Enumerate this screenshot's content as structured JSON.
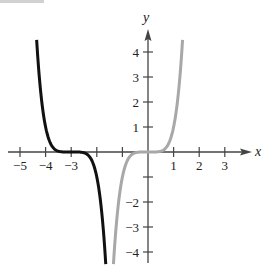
{
  "chart_data": {
    "type": "line",
    "title": "",
    "xlabel": "x",
    "ylabel": "y",
    "xlim": [
      -5.5,
      4.2
    ],
    "ylim": [
      -4.4,
      4.8
    ],
    "grid": false,
    "legend": null,
    "x_ticks": [
      -5,
      -4,
      -3,
      -2,
      -1,
      1,
      2,
      3
    ],
    "x_tick_labels": [
      "−5",
      "−4",
      "−3",
      "",
      "",
      "1",
      "2",
      "3"
    ],
    "y_ticks": [
      -4,
      -3,
      -2,
      -1,
      1,
      2,
      3,
      4
    ],
    "y_tick_labels": [
      "−4",
      "−3",
      "−2",
      "",
      "1",
      "2",
      "3",
      "4"
    ],
    "series": [
      {
        "name": "black curve",
        "formula": "y = -(x+3)^5",
        "color": "#111111",
        "x_range": [
          -4.35,
          -1.65
        ],
        "points": [
          [
            -4.35,
            4.48
          ],
          [
            -4.2,
            2.49
          ],
          [
            -4.0,
            1.0
          ],
          [
            -3.5,
            0.03
          ],
          [
            -3.0,
            0.0
          ],
          [
            -2.5,
            -0.03
          ],
          [
            -2.0,
            -1.0
          ],
          [
            -1.8,
            -2.49
          ],
          [
            -1.65,
            -4.48
          ]
        ]
      },
      {
        "name": "gray curve",
        "formula": "y = x^5",
        "color": "#a8a8a8",
        "x_range": [
          -1.35,
          1.35
        ],
        "points": [
          [
            -1.35,
            -4.48
          ],
          [
            -1.2,
            -2.49
          ],
          [
            -1.0,
            -1.0
          ],
          [
            -0.5,
            -0.03
          ],
          [
            0.0,
            0.0
          ],
          [
            0.5,
            0.03
          ],
          [
            1.0,
            1.0
          ],
          [
            1.2,
            2.49
          ],
          [
            1.35,
            4.48
          ]
        ]
      }
    ]
  },
  "axes": {
    "x_name": "x",
    "y_name": "y",
    "x_labels": [
      {
        "text": "−5",
        "v": -5
      },
      {
        "text": "−4",
        "v": -4
      },
      {
        "text": "−3",
        "v": -3
      },
      {
        "text": "1",
        "v": 1
      },
      {
        "text": "2",
        "v": 2
      },
      {
        "text": "3",
        "v": 3
      }
    ],
    "y_labels": [
      {
        "text": "4",
        "v": 4
      },
      {
        "text": "3",
        "v": 3
      },
      {
        "text": "2",
        "v": 2
      },
      {
        "text": "1",
        "v": 1
      },
      {
        "text": "−2",
        "v": -2
      },
      {
        "text": "−3",
        "v": -3
      },
      {
        "text": "−4",
        "v": -4
      }
    ]
  }
}
